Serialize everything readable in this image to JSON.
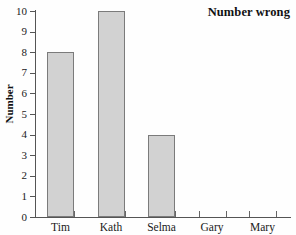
{
  "chart_data": {
    "type": "bar",
    "title": "Number wrong",
    "xlabel": "",
    "ylabel": "Number",
    "categories": [
      "Tim",
      "Kath",
      "Selma",
      "Gary",
      "Mary"
    ],
    "values": [
      8,
      10,
      4,
      0,
      0
    ],
    "ylim": [
      0,
      10
    ],
    "y_ticks": [
      "0",
      "1",
      "2",
      "3",
      "4",
      "5",
      "6",
      "7",
      "8",
      "9",
      "10"
    ],
    "grid": false,
    "legend": null,
    "bar_fill_color": "#d2d2d2",
    "bar_border_color": "#7b7b7b",
    "axis_color": "#555555",
    "background_color": "#ffffff"
  }
}
